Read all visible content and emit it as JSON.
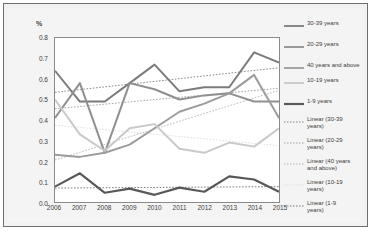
{
  "chart_data": {
    "type": "line",
    "title": "",
    "xlabel": "",
    "ylabel": "%",
    "categories": [
      "2006",
      "2007",
      "2008",
      "2009",
      "2010",
      "2011",
      "2012",
      "2013",
      "2014",
      "2015"
    ],
    "ylim": [
      0.0,
      0.8
    ],
    "ytick_step": 0.1,
    "grid": false,
    "legend_position": "right",
    "series": [
      {
        "name": "30-39 years",
        "color": "#7b7b7b",
        "width": 2.0,
        "values": [
          0.64,
          0.49,
          0.49,
          0.58,
          0.67,
          0.54,
          0.56,
          0.56,
          0.73,
          0.68
        ]
      },
      {
        "name": "20-29 years",
        "color": "#8f8f8f",
        "width": 2.0,
        "values": [
          0.41,
          0.58,
          0.24,
          0.58,
          0.55,
          0.5,
          0.52,
          0.53,
          0.49,
          0.49
        ]
      },
      {
        "name": "40 years and above",
        "color": "#9c9c9c",
        "width": 2.0,
        "values": [
          0.23,
          0.22,
          0.24,
          0.28,
          0.36,
          0.44,
          0.48,
          0.53,
          0.62,
          0.41
        ]
      },
      {
        "name": "10-19 years",
        "color": "#c9c9c9",
        "width": 2.0,
        "values": [
          0.5,
          0.33,
          0.25,
          0.36,
          0.38,
          0.26,
          0.24,
          0.29,
          0.27,
          0.36
        ]
      },
      {
        "name": "1-9 years",
        "color": "#585858",
        "width": 2.2,
        "values": [
          0.075,
          0.14,
          0.045,
          0.065,
          0.035,
          0.07,
          0.05,
          0.125,
          0.11,
          0.05
        ]
      }
    ],
    "trendlines": [
      {
        "name": "Linear (30-39 years)",
        "label": "Linear (30-39\nyears)",
        "color": "#7b7b7b",
        "start": 0.535,
        "end": 0.655
      },
      {
        "name": "Linear (20-29 years)",
        "label": "Linear (20-29\nyears)",
        "color": "#9a9a9a",
        "start": 0.455,
        "end": 0.555
      },
      {
        "name": "Linear (40 years and above)",
        "label": "Linear (40 years\nand above)",
        "color": "#b0b0b0",
        "start": 0.205,
        "end": 0.545
      },
      {
        "name": "Linear (10-19 years)",
        "label": "Linear (10-19\nyears)",
        "color": "#dadada",
        "start": 0.375,
        "end": 0.275
      },
      {
        "name": "Linear (1-9 years)",
        "label": "Linear (1-9\nyears)",
        "color": "#6a6a6a",
        "start": 0.068,
        "end": 0.075
      }
    ]
  },
  "axis": {
    "unit_label": "%",
    "yticks": [
      "0.8",
      "0.7",
      "0.6",
      "0.5",
      "0.4",
      "0.3",
      "0.2",
      "0.1",
      "0.0"
    ],
    "xticks": [
      "2006",
      "2007",
      "2008",
      "2009",
      "2010",
      "2011",
      "2012",
      "2013",
      "2014",
      "2015"
    ]
  }
}
